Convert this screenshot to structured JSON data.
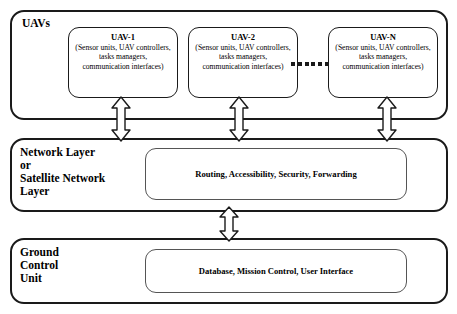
{
  "diagram": {
    "layers": [
      {
        "id": "uavs",
        "label": "UAVs"
      },
      {
        "id": "network",
        "label": "Network Layer\nor\nSatellite Network\nLayer",
        "content": "Routing, Accessibility, Security, Forwarding"
      },
      {
        "id": "ground",
        "label": "Ground\nControl\nUnit",
        "content": "Database, Mission Control, User Interface"
      }
    ],
    "uav_nodes": [
      {
        "name": "UAV-1",
        "description": "(Sensor units, UAV controllers, tasks managers, communication interfaces)"
      },
      {
        "name": "UAV-2",
        "description": "(Sensor units, UAV controllers, tasks managers, communication interfaces)"
      },
      {
        "name": "UAV-N",
        "description": "(Sensor units, UAV controllers, tasks managers, communication interfaces)"
      }
    ],
    "ellipsis_dot_count": 6,
    "colors": {
      "outline": "#1a1a1a",
      "inner_outline": "#555555",
      "background": "#ffffff",
      "text": "#000000"
    },
    "connectors": [
      {
        "name": "uav1-to-network",
        "type": "double-headed-arrow"
      },
      {
        "name": "uav2-to-network",
        "type": "double-headed-arrow"
      },
      {
        "name": "uavn-to-network",
        "type": "double-headed-arrow"
      },
      {
        "name": "network-to-ground",
        "type": "double-headed-arrow"
      }
    ]
  }
}
